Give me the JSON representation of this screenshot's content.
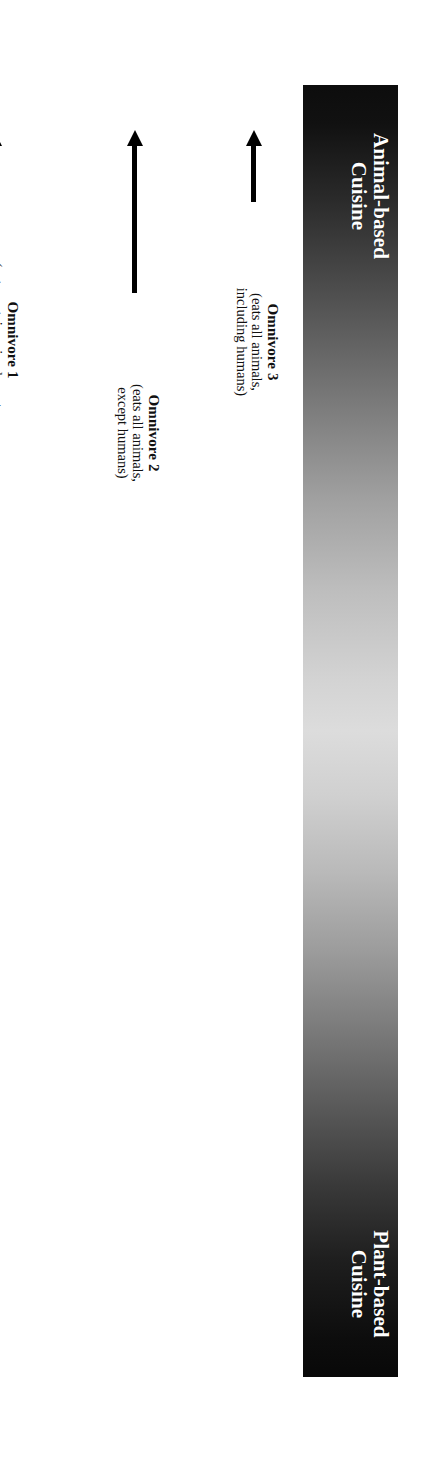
{
  "figure": {
    "type": "spectrum-diagram",
    "orientation": "rotated-90",
    "background_color": "#ffffff",
    "bar": {
      "name": "cuisine-spectrum-bar",
      "gradient_dark_color": "#0d0d0d",
      "gradient_light_color": "#dcdcdc",
      "end_labels": [
        {
          "id": "animal-based",
          "text": "Animal-based\nCuisine",
          "color": "#ffffff"
        },
        {
          "id": "plant-based",
          "text": "Plant-based\nCuisine",
          "color": "#ffffff"
        }
      ]
    },
    "arrow_color": "#000000",
    "items": [
      {
        "id": "omnivore-3",
        "title": "Omnivore 3",
        "desc": "(eats all animals,\nincluding humans)",
        "pos": 168,
        "tail": 202,
        "short": true
      },
      {
        "id": "omnivore-2",
        "title": "Omnivore 2",
        "desc": "(eats all animals,\nexcept humans)",
        "pos": 287,
        "tail": 293,
        "short": false
      },
      {
        "id": "omnivore-1",
        "title": "Omnivore 1",
        "desc": "(eats certain animals parts;\nexcludes others)",
        "pos": 428,
        "tail": 200,
        "short": true
      },
      {
        "id": "semi-vegetarian",
        "title": "Semi-vegetarian",
        "desc": "(eats certain animals;\nexcludes others)",
        "pos": 568,
        "tail": 293,
        "short": false
      },
      {
        "id": "lacto-ovo-fish-vegetarian",
        "title": "Lacto-Ovo-Fish Vegetarian",
        "desc": "(fish, eggs, and dairy ok; but\nno meat)",
        "pos": 731,
        "tail": 200,
        "short": true
      },
      {
        "id": "lacto-ovo-vegetarian",
        "title": "Lacto-Ovo\nVegetarian",
        "desc": "(no meat or fish;\neggs and dairy ok)",
        "pos": 893,
        "tail": 292,
        "short": false
      },
      {
        "id": "lacto-vegetarian",
        "title": "Lacto- Vegetarian",
        "desc": "(no meat, fish, or eggs)",
        "pos": 1021,
        "tail": 198,
        "short": true
      },
      {
        "id": "vegan",
        "title": "Vegan",
        "desc": "(no animal products)",
        "pos": 1147,
        "tail": 290,
        "short": false
      },
      {
        "id": "raw-foods",
        "title": "Raw Foods",
        "desc": "(no cooked foods)",
        "pos": 1286,
        "tail": 200,
        "short": true
      }
    ]
  }
}
